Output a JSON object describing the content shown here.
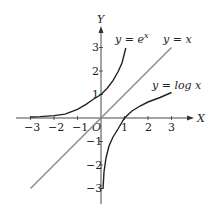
{
  "diagram": {
    "title": "",
    "axes": {
      "x_label": "X",
      "y_label": "Y",
      "origin_label": "O",
      "x_ticks": [
        "−3",
        "−2",
        "−1",
        "1",
        "2",
        "3"
      ],
      "y_ticks": [
        "3",
        "2",
        "1",
        "−1",
        "−2",
        "−3"
      ]
    },
    "curves": [
      {
        "name": "exp",
        "label": "y = e^x",
        "label_main": "y = e",
        "label_sup": "x",
        "color": "#222222"
      },
      {
        "name": "identity",
        "label": "y = x",
        "color": "#8a8a8a"
      },
      {
        "name": "log",
        "label": "y = log x",
        "color": "#222222"
      }
    ]
  }
}
